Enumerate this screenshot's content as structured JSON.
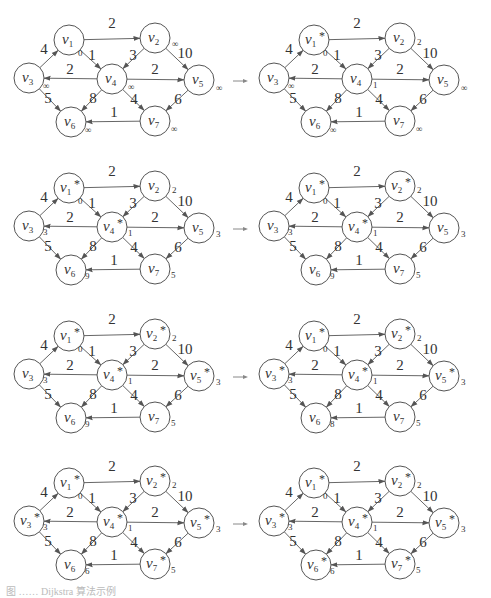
{
  "figure": {
    "caption": "图 …… Dijkstra 算法示例",
    "node_names": [
      "v1",
      "v2",
      "v3",
      "v4",
      "v5",
      "v6",
      "v7"
    ],
    "edges": [
      {
        "from": "v1",
        "to": "v2",
        "weight": "2"
      },
      {
        "from": "v3",
        "to": "v1",
        "weight": "4"
      },
      {
        "from": "v1",
        "to": "v4",
        "weight": "1"
      },
      {
        "from": "v2",
        "to": "v4",
        "weight": "3"
      },
      {
        "from": "v2",
        "to": "v5",
        "weight": "10"
      },
      {
        "from": "v4",
        "to": "v3",
        "weight": "2"
      },
      {
        "from": "v4",
        "to": "v5",
        "weight": "2"
      },
      {
        "from": "v3",
        "to": "v6",
        "weight": "5"
      },
      {
        "from": "v4",
        "to": "v6",
        "weight": "8"
      },
      {
        "from": "v4",
        "to": "v7",
        "weight": "4"
      },
      {
        "from": "v5",
        "to": "v7",
        "weight": "6"
      },
      {
        "from": "v7",
        "to": "v6",
        "weight": "1"
      }
    ],
    "steps": [
      {
        "dist": {
          "v1": "0",
          "v2": "∞",
          "v3": "∞",
          "v4": "∞",
          "v5": "∞",
          "v6": "∞",
          "v7": "∞"
        },
        "known": []
      },
      {
        "dist": {
          "v1": "0",
          "v2": "2",
          "v3": "∞",
          "v4": "1",
          "v5": "∞",
          "v6": "∞",
          "v7": "∞"
        },
        "known": [
          "v1"
        ]
      },
      {
        "dist": {
          "v1": "0",
          "v2": "2",
          "v3": "3",
          "v4": "1",
          "v5": "3",
          "v6": "9",
          "v7": "5"
        },
        "known": [
          "v1",
          "v4"
        ]
      },
      {
        "dist": {
          "v1": "0",
          "v2": "2",
          "v3": "3",
          "v4": "1",
          "v5": "3",
          "v6": "9",
          "v7": "5"
        },
        "known": [
          "v1",
          "v2",
          "v4"
        ]
      },
      {
        "dist": {
          "v1": "0",
          "v2": "2",
          "v3": "3",
          "v4": "1",
          "v5": "3",
          "v6": "9",
          "v7": "5"
        },
        "known": [
          "v1",
          "v2",
          "v4",
          "v5"
        ]
      },
      {
        "dist": {
          "v1": "0",
          "v2": "2",
          "v3": "3",
          "v4": "1",
          "v5": "3",
          "v6": "8",
          "v7": "5"
        },
        "known": [
          "v1",
          "v2",
          "v3",
          "v4",
          "v5"
        ]
      },
      {
        "dist": {
          "v1": "0",
          "v2": "2",
          "v3": "3",
          "v4": "1",
          "v5": "3",
          "v6": "6",
          "v7": "5"
        },
        "known": [
          "v1",
          "v2",
          "v3",
          "v4",
          "v5",
          "v7"
        ]
      },
      {
        "dist": {
          "v1": "0",
          "v2": "2",
          "v3": "3",
          "v4": "1",
          "v5": "3",
          "v6": "6",
          "v7": "5"
        },
        "known": [
          "v1",
          "v2",
          "v3",
          "v4",
          "v5",
          "v6",
          "v7"
        ]
      }
    ],
    "star_symbol": "*",
    "arrow_symbol": "→"
  }
}
